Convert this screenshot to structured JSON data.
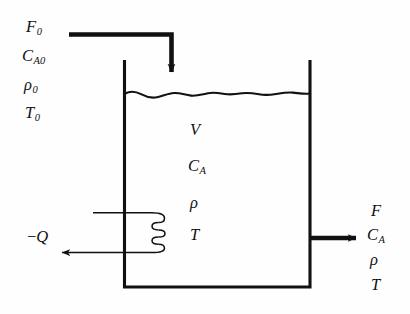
{
  "diagram": {
    "type": "process-flow-diagram",
    "stroke_color": "#111111",
    "background_color": "#fefefe",
    "inlet_stream": {
      "name": "feed-stream",
      "labels": [
        {
          "symbol": "F",
          "subscript": "0"
        },
        {
          "symbol": "C",
          "subscript": "A0"
        },
        {
          "symbol": "ρ",
          "subscript": "0"
        },
        {
          "symbol": "T",
          "subscript": "0"
        }
      ]
    },
    "vessel_contents": {
      "name": "reactor-contents",
      "labels": [
        {
          "symbol": "V",
          "subscript": ""
        },
        {
          "symbol": "C",
          "subscript": "A"
        },
        {
          "symbol": "ρ",
          "subscript": ""
        },
        {
          "symbol": "T",
          "subscript": ""
        }
      ]
    },
    "outlet_stream": {
      "name": "product-stream",
      "labels": [
        {
          "symbol": "F",
          "subscript": ""
        },
        {
          "symbol": "C",
          "subscript": "A"
        },
        {
          "symbol": "ρ",
          "subscript": ""
        },
        {
          "symbol": "T",
          "subscript": ""
        }
      ]
    },
    "heat_stream": {
      "name": "heat-removal",
      "sign": "−",
      "symbol": "Q"
    },
    "elements": {
      "tank": "reactor-vessel",
      "liquid_surface": "liquid-level-line",
      "cooling_coil": "cooling-coil",
      "inlet_pipe": "inlet-pipe-arrow",
      "outlet_pipe": "outlet-pipe-arrow",
      "heat_arrow": "heat-out-arrow"
    }
  }
}
